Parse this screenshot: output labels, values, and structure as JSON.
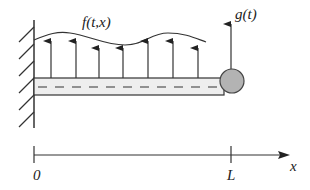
{
  "diagram": {
    "labels": {
      "distributed_load": "f(t,x)",
      "tip_force": "g(t)",
      "origin": "0",
      "length": "L",
      "axis": "x"
    },
    "colors": {
      "stroke": "#333333",
      "beam_fill": "#eeeeee",
      "mass_fill": "#b3b3b3",
      "background": "#ffffff"
    },
    "geometry": {
      "wall_x": 34,
      "beam": {
        "x1": 34,
        "x2": 222,
        "y_top": 78,
        "y_bottom": 95
      },
      "tip_mass": {
        "cx": 232,
        "cy": 81,
        "r": 12
      },
      "load_arrows_x": [
        51,
        76,
        99,
        123,
        148,
        173,
        198
      ],
      "load_arrows_tip_y": [
        41,
        41,
        48,
        48,
        41,
        41,
        48
      ],
      "axis": {
        "y": 155,
        "x_start": 34,
        "x_end": 290,
        "tick_L_x": 231
      }
    }
  }
}
